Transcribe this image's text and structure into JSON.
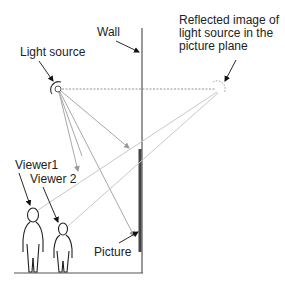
{
  "labels": {
    "wall": "Wall",
    "light_source": "Light source",
    "reflected": "Reflected image of\nlight source in the\npicture plane",
    "viewer1": "Viewer1",
    "viewer2": "Viewer 2",
    "picture": "Picture"
  },
  "colors": {
    "line": "#333333",
    "ray": "#a8a8a8",
    "sightline": "#c8c8c8",
    "picture": "#444444"
  }
}
